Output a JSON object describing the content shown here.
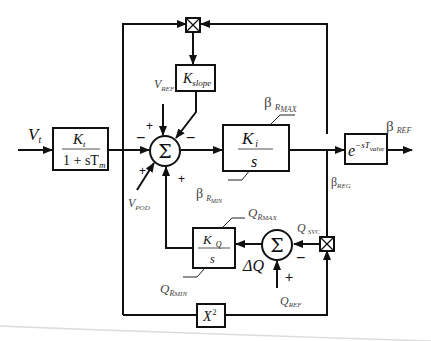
{
  "diagram": {
    "type": "control-block-diagram",
    "inputs": {
      "vt": {
        "main": "V",
        "sub": "t"
      },
      "vref": {
        "main": "V",
        "sub": "REF"
      },
      "vpod": {
        "main": "V",
        "sub": "POD"
      },
      "qref": {
        "main": "Q",
        "sub": "REF"
      }
    },
    "blocks": {
      "lag": {
        "num_main": "K",
        "num_sub": "t",
        "den": "1 + sT",
        "den_sub": "m"
      },
      "kslope": {
        "main": "K",
        "sub": "slope"
      },
      "integrator": {
        "num_main": "K",
        "num_sub": "i",
        "den": "s"
      },
      "delay": {
        "base": "e",
        "exp": "−sT",
        "exp_sub": "valve"
      },
      "kq": {
        "num_main": "K",
        "num_sub": "Q",
        "den": "s"
      },
      "square": {
        "main": "X",
        "exp": "2"
      }
    },
    "sums": {
      "main": {
        "symbol": "Σ",
        "signs": {
          "left": "−",
          "top_left": "+",
          "top_right": "−",
          "bottom_left": "+",
          "bottom_right": "+"
        }
      },
      "q": {
        "symbol": "Σ",
        "signs": {
          "right": "−",
          "bottom": "+"
        }
      }
    },
    "limits": {
      "beta_max": {
        "greek": "β",
        "sub": "R",
        "subsub": "MAX"
      },
      "beta_min": {
        "greek": "β",
        "sub": "R",
        "subsub": "MIN"
      },
      "q_max": {
        "main": "Q",
        "sub": "R",
        "subsub": "MAX"
      },
      "q_min": {
        "main": "Q",
        "sub": "R",
        "subsub": "MIN"
      }
    },
    "signals": {
      "beta_ref": {
        "greek": "β",
        "sub": "REF"
      },
      "beta_reg": {
        "greek": "β",
        "sub": "REG"
      },
      "q_svc": {
        "main": "Q",
        "sub": "SVC"
      },
      "delta_q": {
        "main": "ΔQ"
      }
    },
    "multipliers": [
      "multiplier-top",
      "multiplier-right"
    ],
    "colors": {
      "line": "#111111",
      "background": "#ffffff",
      "shadow": "#d8d8d8"
    }
  }
}
